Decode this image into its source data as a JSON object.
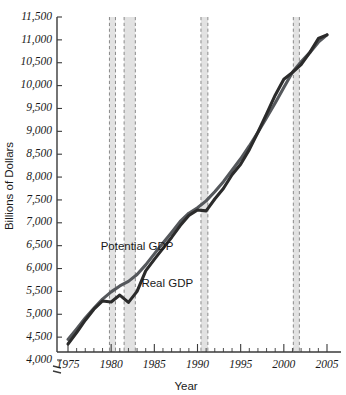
{
  "chart_data": {
    "type": "line",
    "title": "",
    "xlabel": "Year",
    "ylabel": "Billions of Dollars",
    "xlim": [
      1975,
      2005
    ],
    "ylim": [
      4000,
      11500
    ],
    "y_axis_break": true,
    "grid": false,
    "legend_position": "inline-annotations",
    "ytick_labels": [
      "4,000",
      "4,500",
      "5,000",
      "5,500",
      "6,000",
      "6,500",
      "7,000",
      "7,500",
      "8,000",
      "8,500",
      "9,000",
      "9,500",
      "10,000",
      "10,500",
      "11,000",
      "11,500"
    ],
    "ytick_values": [
      4000,
      4500,
      5000,
      5500,
      6000,
      6500,
      7000,
      7500,
      8000,
      8500,
      9000,
      9500,
      10000,
      10500,
      11000,
      11500
    ],
    "xtick_labels": [
      "1975",
      "1980",
      "1985",
      "1990",
      "1995",
      "2000",
      "2005"
    ],
    "xtick_values": [
      1975,
      1980,
      1985,
      1990,
      1995,
      2000,
      2005
    ],
    "xtick_minor_step": 1,
    "x": [
      1975,
      1976,
      1977,
      1978,
      1979,
      1980,
      1981,
      1982,
      1983,
      1984,
      1985,
      1986,
      1987,
      1988,
      1989,
      1990,
      1991,
      1992,
      1993,
      1994,
      1995,
      1996,
      1997,
      1998,
      1999,
      2000,
      2001,
      2002,
      2003,
      2004,
      2005
    ],
    "series": [
      {
        "name": "Potential GDP",
        "color": "#55585c",
        "label_x": 1983,
        "label_y": 6400,
        "values": [
          4450,
          4680,
          4920,
          5130,
          5330,
          5490,
          5620,
          5720,
          5870,
          6080,
          6320,
          6560,
          6790,
          7030,
          7210,
          7330,
          7480,
          7680,
          7900,
          8150,
          8400,
          8680,
          8980,
          9300,
          9620,
          9960,
          10290,
          10520,
          10720,
          10950,
          11110
        ]
      },
      {
        "name": "Real GDP",
        "color": "#2b2b2b",
        "label_x": 1986.5,
        "label_y": 5600,
        "values": [
          4350,
          4600,
          4870,
          5110,
          5290,
          5270,
          5420,
          5260,
          5500,
          5950,
          6200,
          6440,
          6680,
          6940,
          7160,
          7280,
          7260,
          7520,
          7750,
          8050,
          8280,
          8600,
          8980,
          9380,
          9790,
          10140,
          10290,
          10460,
          10720,
          11030,
          11110
        ]
      }
    ],
    "recession_bands": [
      {
        "start": 1979.8,
        "end": 1980.5
      },
      {
        "start": 1981.5,
        "end": 1982.8
      },
      {
        "start": 1990.4,
        "end": 1991.2
      },
      {
        "start": 2001.1,
        "end": 2001.8
      }
    ]
  }
}
